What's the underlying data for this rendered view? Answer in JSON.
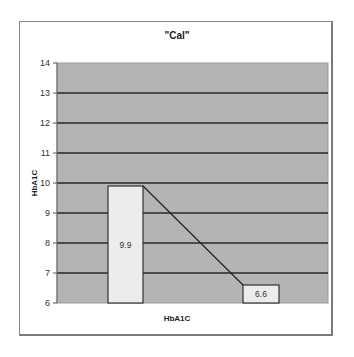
{
  "chart_data": {
    "type": "bar",
    "title": "\"Cal\"",
    "xlabel": "HbA1C",
    "ylabel": "HbA1C",
    "ylim": [
      6,
      14
    ],
    "yticks": [
      6,
      7,
      8,
      9,
      10,
      11,
      12,
      13,
      14
    ],
    "grid": true,
    "legend": null,
    "categories": [
      "",
      ""
    ],
    "values": [
      9.9,
      6.6
    ],
    "data_labels": [
      "9.9",
      "6.6"
    ],
    "overlay_line": {
      "description": "line connecting bar tops",
      "points": [
        [
          0,
          9.9
        ],
        [
          1,
          6.6
        ]
      ]
    },
    "colors": {
      "plot_background": "#b4b4b4",
      "bar_fill": "#ececec",
      "gridline": "#2a2a2a",
      "line": "#222222"
    }
  }
}
